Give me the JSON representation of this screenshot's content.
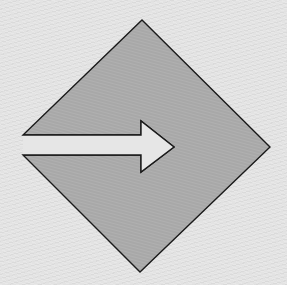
{
  "figure": {
    "title": "Merge / enter arrow into diamond",
    "background_color": "#e3e3e3",
    "diamond": {
      "fill": "#a8a8a8",
      "stroke": "#1a1a1a",
      "vertices": {
        "top": [
          142,
          20
        ],
        "right": [
          270,
          147
        ],
        "bottom": [
          140,
          272
        ],
        "left_upper": [
          23,
          135
        ],
        "left_lower": [
          23,
          155
        ]
      }
    },
    "arrow": {
      "icon": "arrow-right-icon",
      "fill": "#e6e6e6",
      "stroke": "#1a1a1a",
      "shaft_top": 135,
      "shaft_bottom": 155,
      "shaft_start_x": 23,
      "head_base_x": 141,
      "head_top": [
        141,
        121
      ],
      "head_bottom": [
        141,
        172
      ],
      "tip": [
        174,
        147
      ]
    }
  }
}
